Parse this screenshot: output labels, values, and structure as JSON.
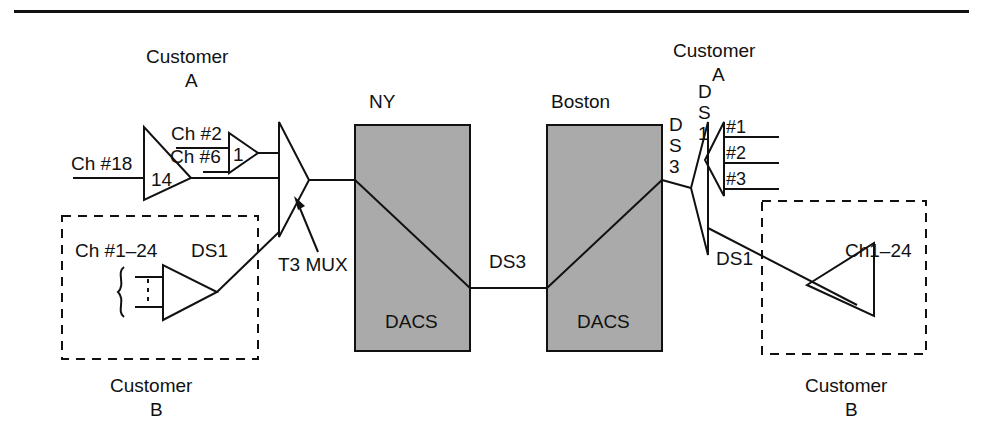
{
  "figure": {
    "top_rule": true
  },
  "colors": {
    "line": "#111111",
    "dacs_fill": "#aaaaaa",
    "background": "#ffffff"
  },
  "labels": {
    "customer_a_left": "Customer\nA",
    "customer_a_left_line1": "Customer",
    "customer_a_left_line2": "A",
    "customer_b_left_line1": "Customer",
    "customer_b_left_line2": "B",
    "customer_a_right_line1": "Customer",
    "customer_a_right_line2": "A",
    "customer_b_right_line1": "Customer",
    "customer_b_right_line2": "B",
    "ch18": "Ch #18",
    "ch2": "Ch #2",
    "ch6": "Ch #6",
    "mux14": "14",
    "mux1": "1",
    "t3mux": "T3 MUX",
    "ny": "NY",
    "boston": "Boston",
    "dacs_ny": "DACS",
    "dacs_boston": "DACS",
    "ds3_link": "DS3",
    "ds1_left_box": "DS1",
    "ch_1_24_left": "Ch #1–24",
    "ds3_right_d": "D",
    "ds3_right_s": "S",
    "ds3_right_3": "3",
    "ds1_right_d": "D",
    "ds1_right_s": "S",
    "ds1_right_1": "1",
    "out1": "#1",
    "out2": "#2",
    "out3": "#3",
    "ds1_right_box": "DS1",
    "ch1_24_right": "Ch1–24"
  },
  "nodes": {
    "mux_14": {
      "label": "14",
      "type": "channel-mux",
      "inputs": [
        "Ch #18"
      ]
    },
    "mux_1": {
      "label": "1",
      "type": "channel-mux",
      "inputs": [
        "Ch #2",
        "Ch #6"
      ]
    },
    "t3_mux": {
      "label": "T3 MUX",
      "type": "t3-multiplexer"
    },
    "dacs_ny": {
      "label": "DACS",
      "site": "NY"
    },
    "dacs_boston": {
      "label": "DACS",
      "site": "Boston"
    },
    "demux_ds3": {
      "label": "DS3",
      "type": "ds3-demultiplexer"
    },
    "demux_ds1": {
      "label": "DS1",
      "type": "ds1-demultiplexer",
      "outputs": [
        "#1",
        "#2",
        "#3"
      ]
    },
    "cust_b_left_mux": {
      "label": "Ch #1–24",
      "output": "DS1"
    },
    "cust_b_right_demux": {
      "label": "Ch1–24",
      "input": "DS1"
    }
  },
  "links": [
    {
      "from": "t3_mux",
      "to": "dacs_ny",
      "label": ""
    },
    {
      "from": "dacs_ny",
      "to": "dacs_boston",
      "label": "DS3"
    },
    {
      "from": "dacs_boston",
      "to": "demux_ds3",
      "label": ""
    },
    {
      "from": "demux_ds3",
      "to": "cust_b_right_demux",
      "label": "DS1"
    },
    {
      "from": "cust_b_left_mux",
      "to": "t3_mux",
      "label": "DS1"
    }
  ]
}
